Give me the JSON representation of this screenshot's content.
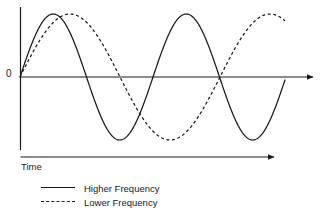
{
  "chart_data": {
    "type": "line",
    "title": "",
    "subtitle": "",
    "xlabel": "Time",
    "ylabel": "",
    "grid": false,
    "legend_position": "bottom-left",
    "x_axis": {
      "label": "Time",
      "has_arrow": true,
      "tick_labels": [],
      "range_px": [
        20,
        320
      ]
    },
    "y_axis": {
      "label": "",
      "origin_label": "0",
      "tick_labels": [
        "0"
      ],
      "range": [
        -1,
        1
      ]
    },
    "annotations": [
      "0",
      "Time"
    ],
    "series": [
      {
        "name": "Higher Frequency",
        "style": "solid",
        "color": "#1a1a1a",
        "waveform": "sine",
        "amplitude": 1,
        "period_px": 133,
        "cycles": 2,
        "phase": 0,
        "peaks_x": [
          52,
          185
        ],
        "troughs_x": [
          118,
          252
        ],
        "zero_crossings_x": [
          20,
          85,
          152,
          218,
          285
        ]
      },
      {
        "name": "Lower Frequency",
        "style": "dashed",
        "color": "#1a1a1a",
        "waveform": "sine",
        "amplitude": 1,
        "period_px": 200,
        "cycles": 1.33,
        "phase": 0,
        "peaks_x": [
          85
        ],
        "troughs_x": [
          218
        ],
        "zero_crossings_x": [
          20,
          152,
          285
        ]
      }
    ]
  },
  "axes": {
    "zero_label": "0"
  },
  "time_axis": {
    "label": "Time"
  },
  "legend": {
    "items": [
      {
        "label": "Higher Frequency",
        "style": "solid"
      },
      {
        "label": "Lower Frequency",
        "style": "dashed"
      }
    ]
  },
  "colors": {
    "stroke": "#1a1a1a",
    "background": "#ffffff"
  }
}
